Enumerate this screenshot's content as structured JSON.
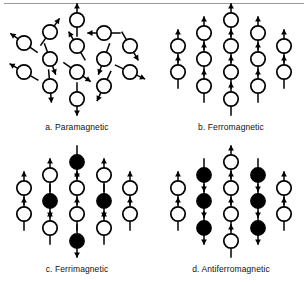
{
  "figure": {
    "background_color": "#ffffff",
    "ink_color": "#000000",
    "rule_color": "#9a9a9a",
    "panels": [
      {
        "id": "paramagnetic",
        "caption": "a. Paramagnetic",
        "ordering": "random",
        "description": "Open circles with magnetic moment arrows pointing in random directions",
        "spin_fill": "open",
        "sites": [
          {
            "x": 77,
            "y": 14,
            "angle": 0,
            "fill": "open"
          },
          {
            "x": 104,
            "y": 27,
            "angle": 270,
            "fill": "open"
          },
          {
            "x": 50,
            "y": 26,
            "angle": 35,
            "fill": "open"
          },
          {
            "x": 24,
            "y": 37,
            "angle": 305,
            "fill": "open"
          },
          {
            "x": 130,
            "y": 40,
            "angle": 150,
            "fill": "open"
          },
          {
            "x": 77,
            "y": 40,
            "angle": 330,
            "fill": "open"
          },
          {
            "x": 50,
            "y": 53,
            "angle": 160,
            "fill": "open"
          },
          {
            "x": 104,
            "y": 53,
            "angle": 200,
            "fill": "open"
          },
          {
            "x": 24,
            "y": 66,
            "angle": 300,
            "fill": "open"
          },
          {
            "x": 77,
            "y": 66,
            "angle": 125,
            "fill": "open"
          },
          {
            "x": 130,
            "y": 66,
            "angle": 115,
            "fill": "open"
          },
          {
            "x": 50,
            "y": 80,
            "angle": 175,
            "fill": "open"
          },
          {
            "x": 104,
            "y": 80,
            "angle": 205,
            "fill": "open"
          },
          {
            "x": 77,
            "y": 93,
            "angle": 180,
            "fill": "open"
          }
        ]
      },
      {
        "id": "ferromagnetic",
        "caption": "b. Ferromagnetic",
        "ordering": "parallel",
        "description": "All moments aligned parallel, all circles open, arrows up",
        "sites": [
          {
            "x": 24,
            "y": 40,
            "angle": 0,
            "fill": "open"
          },
          {
            "x": 24,
            "y": 66,
            "angle": 0,
            "fill": "open"
          },
          {
            "x": 50,
            "y": 27,
            "angle": 0,
            "fill": "open"
          },
          {
            "x": 50,
            "y": 53,
            "angle": 0,
            "fill": "open"
          },
          {
            "x": 50,
            "y": 80,
            "angle": 0,
            "fill": "open"
          },
          {
            "x": 77,
            "y": 14,
            "angle": 0,
            "fill": "open"
          },
          {
            "x": 77,
            "y": 40,
            "angle": 0,
            "fill": "open"
          },
          {
            "x": 77,
            "y": 66,
            "angle": 0,
            "fill": "open"
          },
          {
            "x": 77,
            "y": 93,
            "angle": 0,
            "fill": "open"
          },
          {
            "x": 104,
            "y": 27,
            "angle": 0,
            "fill": "open"
          },
          {
            "x": 104,
            "y": 53,
            "angle": 0,
            "fill": "open"
          },
          {
            "x": 104,
            "y": 80,
            "angle": 0,
            "fill": "open"
          },
          {
            "x": 130,
            "y": 40,
            "angle": 0,
            "fill": "open"
          },
          {
            "x": 130,
            "y": 66,
            "angle": 0,
            "fill": "open"
          }
        ]
      },
      {
        "id": "ferrimagnetic",
        "caption": "c. Ferrimagnetic",
        "ordering": "antiparallel-unequal",
        "description": "Mixed open (up) and filled (down) moments of unequal magnitude",
        "sites": [
          {
            "x": 24,
            "y": 40,
            "angle": 0,
            "fill": "open"
          },
          {
            "x": 24,
            "y": 66,
            "angle": 0,
            "fill": "open"
          },
          {
            "x": 50,
            "y": 27,
            "angle": 0,
            "fill": "open"
          },
          {
            "x": 50,
            "y": 53,
            "angle": 180,
            "fill": "filled"
          },
          {
            "x": 50,
            "y": 80,
            "angle": 0,
            "fill": "open"
          },
          {
            "x": 77,
            "y": 14,
            "angle": 180,
            "fill": "filled"
          },
          {
            "x": 77,
            "y": 40,
            "angle": 0,
            "fill": "open"
          },
          {
            "x": 77,
            "y": 66,
            "angle": 0,
            "fill": "open"
          },
          {
            "x": 77,
            "y": 93,
            "angle": 180,
            "fill": "filled"
          },
          {
            "x": 104,
            "y": 27,
            "angle": 0,
            "fill": "open"
          },
          {
            "x": 104,
            "y": 53,
            "angle": 180,
            "fill": "filled"
          },
          {
            "x": 104,
            "y": 80,
            "angle": 0,
            "fill": "open"
          },
          {
            "x": 130,
            "y": 40,
            "angle": 0,
            "fill": "open"
          },
          {
            "x": 130,
            "y": 66,
            "angle": 0,
            "fill": "open"
          }
        ]
      },
      {
        "id": "antiferromagnetic",
        "caption": "d. Antiferromagnetic",
        "ordering": "antiparallel-equal",
        "description": "Alternating columns of open (up) and filled (down) moments of equal magnitude",
        "sites": [
          {
            "x": 24,
            "y": 40,
            "angle": 0,
            "fill": "open"
          },
          {
            "x": 24,
            "y": 66,
            "angle": 0,
            "fill": "open"
          },
          {
            "x": 50,
            "y": 27,
            "angle": 180,
            "fill": "filled"
          },
          {
            "x": 50,
            "y": 53,
            "angle": 180,
            "fill": "filled"
          },
          {
            "x": 50,
            "y": 80,
            "angle": 180,
            "fill": "filled"
          },
          {
            "x": 77,
            "y": 14,
            "angle": 0,
            "fill": "open"
          },
          {
            "x": 77,
            "y": 40,
            "angle": 0,
            "fill": "open"
          },
          {
            "x": 77,
            "y": 66,
            "angle": 0,
            "fill": "open"
          },
          {
            "x": 77,
            "y": 93,
            "angle": 0,
            "fill": "open"
          },
          {
            "x": 104,
            "y": 27,
            "angle": 180,
            "fill": "filled"
          },
          {
            "x": 104,
            "y": 53,
            "angle": 180,
            "fill": "filled"
          },
          {
            "x": 104,
            "y": 80,
            "angle": 180,
            "fill": "filled"
          },
          {
            "x": 130,
            "y": 40,
            "angle": 0,
            "fill": "open"
          },
          {
            "x": 130,
            "y": 66,
            "angle": 0,
            "fill": "open"
          }
        ]
      }
    ]
  }
}
